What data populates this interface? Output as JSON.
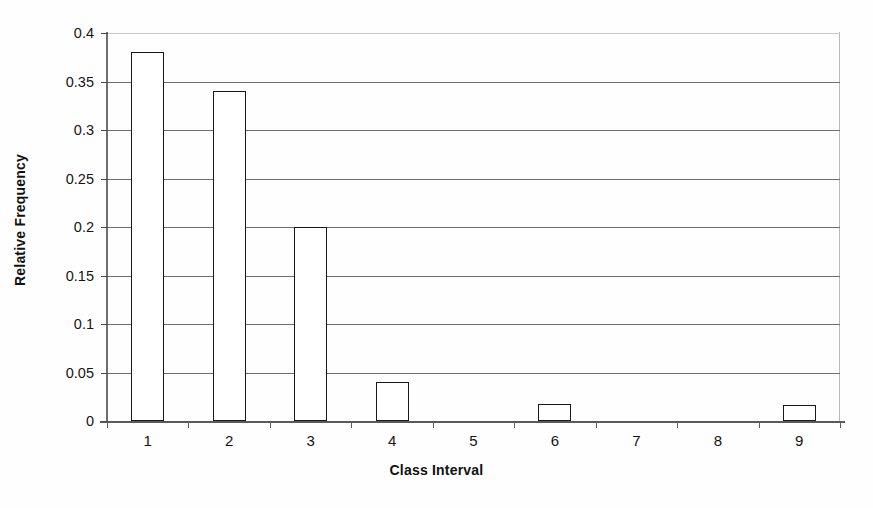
{
  "chart_data": {
    "type": "bar",
    "title": "",
    "xlabel": "Class Interval",
    "ylabel": "Relative Frequency",
    "categories": [
      "1",
      "2",
      "3",
      "4",
      "5",
      "6",
      "7",
      "8",
      "9"
    ],
    "values": [
      0.38,
      0.34,
      0.2,
      0.04,
      0,
      0.018,
      0,
      0,
      0.016
    ],
    "ylim": [
      0,
      0.4
    ],
    "ytick_labels": [
      "0",
      "0.05",
      "0.1",
      "0.15",
      "0.2",
      "0.25",
      "0.3",
      "0.35",
      "0.4"
    ],
    "ytick_values": [
      0,
      0.05,
      0.1,
      0.15,
      0.2,
      0.25,
      0.3,
      0.35,
      0.4
    ],
    "grid": "horizontal",
    "legend": "none",
    "bar_fill_color": "#ffffff",
    "bar_border_color": "#181818",
    "gridline_color": "#6e6e6e",
    "background_color": "#fefefe"
  }
}
